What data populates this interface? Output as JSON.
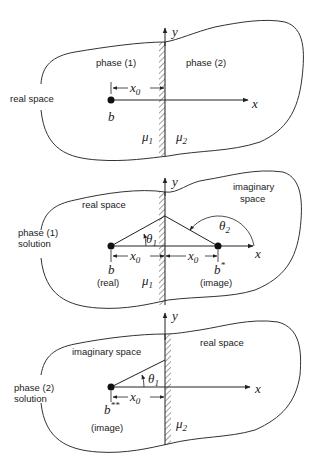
{
  "figure": {
    "panels": [
      {
        "id": "panel-1",
        "region_label": "real space",
        "left_label": "phase (1)",
        "right_label": "phase (2)",
        "axis_x": "x",
        "axis_y": "y",
        "distance_label": "x",
        "distance_sub": "0",
        "point_label": "b",
        "mu_left": "μ",
        "mu_left_sub": "1",
        "mu_right": "μ",
        "mu_right_sub": "2"
      },
      {
        "id": "panel-2",
        "side_label_line1": "phase (1)",
        "side_label_line2": "solution",
        "left_region": "real space",
        "right_region_line1": "imaginary",
        "right_region_line2": "space",
        "axis_x": "x",
        "axis_y": "y",
        "theta1": "θ",
        "theta1_sub": "1",
        "theta2": "θ",
        "theta2_sub": "2",
        "distance_label": "x",
        "distance_sub": "0",
        "point_real": "b",
        "point_real_note": "(real)",
        "point_image": "b",
        "point_image_sup": "*",
        "point_image_note": "(image)",
        "mu_left": "μ",
        "mu_left_sub": "1"
      },
      {
        "id": "panel-3",
        "side_label_line1": "phase (2)",
        "side_label_line2": "solution",
        "left_region": "imaginary space",
        "right_region": "real space",
        "axis_x": "x",
        "axis_y": "y",
        "theta1": "θ",
        "theta1_sub": "1",
        "distance_label": "x",
        "distance_sub": "0",
        "point_image": "b",
        "point_image_sup": "**",
        "point_image_note": "(image)",
        "mu_right": "μ",
        "mu_right_sub": "2"
      }
    ]
  }
}
